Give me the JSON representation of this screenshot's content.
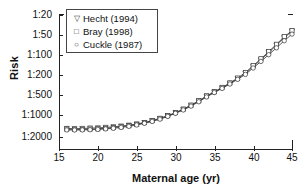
{
  "chart_data": {
    "type": "line",
    "title": "",
    "xlabel": "Maternal age (yr)",
    "ylabel": "Risk",
    "xlim": [
      15,
      45
    ],
    "ylim_labels": [
      "1:20",
      "1:50",
      "1:100",
      "1:200",
      "1:500",
      "1:1000",
      "1:2000"
    ],
    "ytick_labels": [
      "1:20",
      "1:50",
      "1:100",
      "1:200",
      "1:500",
      "1:1000",
      "1:2000"
    ],
    "xtick_labels": [
      "15",
      "20",
      "25",
      "30",
      "35",
      "40",
      "45"
    ],
    "xticks": [
      15,
      20,
      25,
      30,
      35,
      40,
      45
    ],
    "grid": false,
    "legend_position": "top-left",
    "x": [
      16,
      17,
      18,
      19,
      20,
      21,
      22,
      23,
      24,
      25,
      26,
      27,
      28,
      29,
      30,
      31,
      32,
      33,
      34,
      35,
      36,
      37,
      38,
      39,
      40,
      41,
      42,
      43,
      44,
      45
    ],
    "series": [
      {
        "name": "Hecht (1994)",
        "marker": "triangle-down",
        "risk_denominator": [
          1530,
          1540,
          1530,
          1510,
          1500,
          1480,
          1450,
          1420,
          1380,
          1330,
          1270,
          1200,
          1120,
          1030,
          930,
          825,
          720,
          620,
          525,
          440,
          362,
          295,
          237,
          189,
          150,
          118,
          92,
          71,
          55,
          42
        ]
      },
      {
        "name": "Bray (1998)",
        "marker": "square",
        "risk_denominator": [
          1560,
          1570,
          1570,
          1560,
          1545,
          1520,
          1490,
          1450,
          1400,
          1340,
          1270,
          1195,
          1110,
          1020,
          920,
          815,
          710,
          610,
          515,
          430,
          353,
          287,
          230,
          183,
          145,
          114,
          89,
          69,
          53,
          41
        ]
      },
      {
        "name": "Cuckle (1987)",
        "marker": "circle",
        "risk_denominator": [
          1600,
          1605,
          1600,
          1590,
          1575,
          1550,
          1520,
          1480,
          1430,
          1370,
          1300,
          1225,
          1140,
          1045,
          945,
          840,
          735,
          632,
          535,
          448,
          370,
          302,
          244,
          196,
          157,
          125,
          99,
          78,
          61,
          48
        ]
      }
    ]
  },
  "legend": {
    "items": [
      {
        "label": "Hecht (1994)",
        "glyph": "▽",
        "marker_name": "triangle-down-marker"
      },
      {
        "label": "Bray (1998)",
        "glyph": "□",
        "marker_name": "square-marker"
      },
      {
        "label": "Cuckle (1987)",
        "glyph": "○",
        "marker_name": "circle-marker"
      }
    ]
  },
  "axes": {
    "y_title": "Risk",
    "x_title": "Maternal age (yr)",
    "y_ticks": [
      "1:20",
      "1:50",
      "1:100",
      "1:200",
      "1:500",
      "1:1000",
      "1:2000"
    ],
    "x_ticks": [
      "15",
      "20",
      "25",
      "30",
      "35",
      "40",
      "45"
    ]
  },
  "colors": {
    "axis": "#222222",
    "series_line": "#333333",
    "background": "#ffffff",
    "legend_border": "#444444"
  }
}
